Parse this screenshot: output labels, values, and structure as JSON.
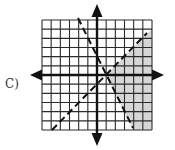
{
  "option_label": "C)",
  "graph": {
    "type": "inequality-graph",
    "grid": {
      "x_min": -6,
      "x_max": 6,
      "y_min": -6,
      "y_max": 6,
      "step": 1
    },
    "axes": {
      "x_arrows": true,
      "y_arrows": true
    },
    "lines": [
      {
        "name": "boundary-line-1",
        "equation": "y = -2x + 2",
        "style": "dashed"
      },
      {
        "name": "boundary-line-2",
        "equation": "y = x - 1",
        "style": "dashed"
      }
    ],
    "intersection": [
      1,
      0
    ],
    "shaded_region": "right of both lines (y < x - 1 and y > -2x + 2)",
    "colors": {
      "grid": "#2b2b2b",
      "shade": "#d6d6d6",
      "axis": "#111111",
      "dash": "#111111"
    }
  }
}
